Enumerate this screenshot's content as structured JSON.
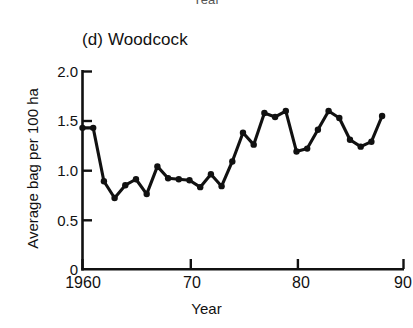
{
  "figure": {
    "cut_top_label": "Year",
    "panel_title": "(d) Woodcock",
    "xlabel": "Year",
    "ylabel": "Average bag per 100 ha"
  },
  "chart_data": {
    "type": "line",
    "title": "(d) Woodcock",
    "xlabel": "Year",
    "ylabel": "Average bag per 100 ha",
    "xlim": [
      1960,
      1990
    ],
    "ylim": [
      0,
      2.0
    ],
    "xticks": [
      1960,
      1970,
      1980,
      1990
    ],
    "xticklabels": [
      "1960",
      "70",
      "80",
      "90"
    ],
    "yticks": [
      0,
      0.5,
      1.0,
      1.5,
      2.0
    ],
    "yticklabels": [
      "0",
      "0.5",
      "1.0",
      "1.5",
      "2.0"
    ],
    "grid": false,
    "legend": null,
    "marker": "filled-circle",
    "line_color": "#111111",
    "x": [
      1960,
      1961,
      1962,
      1963,
      1964,
      1965,
      1966,
      1967,
      1968,
      1969,
      1970,
      1971,
      1972,
      1973,
      1974,
      1975,
      1976,
      1977,
      1978,
      1979,
      1980,
      1981,
      1982,
      1983,
      1984,
      1985,
      1986,
      1987,
      1988
    ],
    "values": [
      1.43,
      1.43,
      0.89,
      0.72,
      0.85,
      0.91,
      0.76,
      1.04,
      0.92,
      0.91,
      0.9,
      0.83,
      0.96,
      0.84,
      1.09,
      1.38,
      1.26,
      1.58,
      1.54,
      1.6,
      1.19,
      1.22,
      1.41,
      1.6,
      1.53,
      1.31,
      1.24,
      1.29,
      1.55
    ],
    "ylabel_unit": "bag per 100 ha"
  }
}
